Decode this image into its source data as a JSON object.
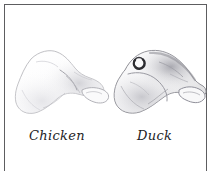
{
  "plate": {
    "background_color": "#ffffff",
    "frame_color": "#5d5d60",
    "ink_color": "#1d1d1f"
  },
  "figures": [
    {
      "id": "chicken",
      "label": "Chicken",
      "icon": "bone-specimen-icon",
      "shading": "light",
      "outline_color": "#b9b9bd",
      "fill_color": "#fcfcfc",
      "shade_color": "#cfcfd4"
    },
    {
      "id": "duck",
      "label": "Duck",
      "icon": "bone-specimen-icon",
      "shading": "dark",
      "outline_color": "#8e8e95",
      "fill_color": "#f7f7f8",
      "shade_color": "#a9a9b0",
      "foramen_color": "#2c2c30"
    }
  ]
}
